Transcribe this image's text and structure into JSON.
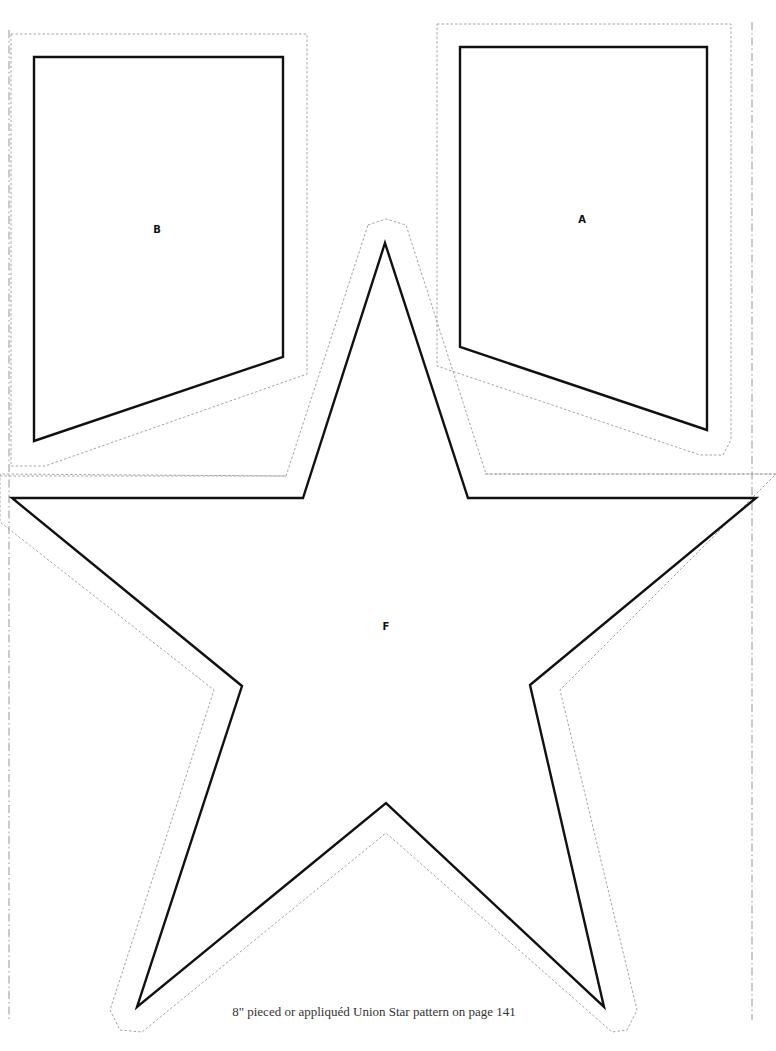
{
  "pieces": {
    "a": {
      "label": "A"
    },
    "b": {
      "label": "B"
    },
    "f": {
      "label": "F"
    }
  },
  "caption": "8\" pieced or appliquéd Union Star pattern on page 141",
  "colors": {
    "cut_line": "#111111",
    "seam_line": "#9a9a9a",
    "background": "#ffffff"
  }
}
